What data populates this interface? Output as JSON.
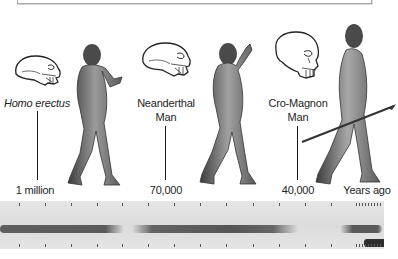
{
  "top_box": {
    "visible": true
  },
  "species": [
    {
      "name": "Homo erectus",
      "label_lines": [
        "Homo erectus"
      ],
      "italic": true,
      "time": "1 million"
    },
    {
      "name": "Neanderthal Man",
      "label_lines": [
        "Neanderthal",
        "Man"
      ],
      "italic": false,
      "time": "70,000"
    },
    {
      "name": "Cro-Magnon Man",
      "label_lines": [
        "Cro-Magnon",
        "Man"
      ],
      "italic": false,
      "time": "40,000"
    }
  ],
  "axis_end_label": "Years ago",
  "timeline": {
    "background_color": "#e0e0e0",
    "band_color": "#5a5a5a",
    "tick_count": 13,
    "segments": [
      {
        "name": "homo-erectus-span",
        "from_x": 0,
        "to_x": 122
      },
      {
        "name": "neanderthal-span",
        "from_x": 140,
        "to_x": 290
      },
      {
        "name": "cro-magnon-span",
        "from_x": 342,
        "to_x": 380
      },
      {
        "name": "modern-span",
        "from_x": 365,
        "to_x": 384
      }
    ]
  },
  "colors": {
    "text": "#1e1e1e",
    "line": "#1a1a1a",
    "figure_skin": "#8a8a8a",
    "figure_shadow": "#3a3a3a"
  }
}
